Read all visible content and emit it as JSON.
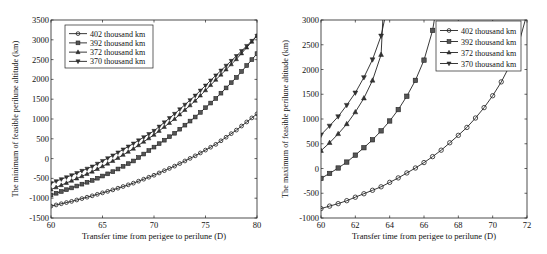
{
  "chart_data": [
    {
      "type": "line",
      "title": "",
      "xlabel": "Transfer time from perigee to perilune (D)",
      "ylabel": "The minimum of feasible perilune altitude (km)",
      "xlim": [
        60,
        80
      ],
      "ylim": [
        -1500,
        3500
      ],
      "xticks": [
        60,
        65,
        70,
        75,
        80
      ],
      "yticks": [
        -1500,
        -1000,
        -500,
        0,
        500,
        1000,
        1500,
        2000,
        2500,
        3000,
        3500
      ],
      "grid": false,
      "legend_position": "upper left",
      "plot_box": {
        "x0": 51,
        "x1": 257,
        "y0": 20,
        "y1": 218
      },
      "legend_box": {
        "x": 65,
        "y": 25,
        "w": 88,
        "h": 43
      },
      "series": [
        {
          "name": "402 thousand km",
          "marker": "circle",
          "x": [
            60,
            62,
            64,
            66,
            68,
            70,
            72,
            74,
            76,
            78,
            80
          ],
          "values": [
            -1200,
            -1080,
            -940,
            -790,
            -620,
            -420,
            -190,
            70,
            360,
            720,
            1130
          ]
        },
        {
          "name": "392 thousand km",
          "marker": "square",
          "x": [
            60,
            62,
            64,
            66,
            68,
            70,
            72,
            74,
            76,
            78,
            80
          ],
          "values": [
            -920,
            -740,
            -550,
            -330,
            -60,
            290,
            640,
            1050,
            1520,
            2050,
            2650
          ]
        },
        {
          "name": "372 thousand km",
          "marker": "triangle-up",
          "x": [
            60,
            62,
            64,
            66,
            68,
            70,
            72,
            74,
            76,
            78,
            80
          ],
          "values": [
            -780,
            -560,
            -330,
            -60,
            250,
            600,
            1000,
            1460,
            1990,
            2510,
            3100
          ]
        },
        {
          "name": "370 thousand km",
          "marker": "triangle-down",
          "x": [
            60,
            62,
            64,
            66,
            68,
            70,
            72,
            74,
            76,
            78,
            80
          ],
          "values": [
            -620,
            -420,
            -200,
            80,
            380,
            700,
            1130,
            1590,
            2100,
            2590,
            3100
          ]
        }
      ]
    },
    {
      "type": "line",
      "title": "",
      "xlabel": "Transfer time from perigee to perilune (D)",
      "ylabel": "The maximum of feasible perilune altitude (km)",
      "xlim": [
        60,
        72
      ],
      "ylim": [
        -1000,
        3000
      ],
      "xticks": [
        60,
        62,
        64,
        66,
        68,
        70,
        72
      ],
      "yticks": [
        -1000,
        -500,
        0,
        500,
        1000,
        1500,
        2000,
        2500,
        3000
      ],
      "grid": false,
      "legend_position": "upper right",
      "plot_box": {
        "x0": 321,
        "x1": 527,
        "y0": 20,
        "y1": 218
      },
      "legend_box": {
        "x": 436,
        "y": 21,
        "w": 85,
        "h": 50
      },
      "series": [
        {
          "name": "402 thousand km",
          "marker": "circle",
          "x": [
            60,
            60.5,
            61,
            61.5,
            62,
            62.5,
            63,
            63.5,
            64,
            64.5,
            65,
            65.5,
            66,
            66.5,
            67,
            67.5,
            68,
            68.5,
            69,
            69.5,
            70,
            70.5,
            71,
            71.5,
            71.9
          ],
          "values": [
            -810,
            -760,
            -710,
            -650,
            -580,
            -510,
            -440,
            -370,
            -280,
            -190,
            -90,
            10,
            120,
            240,
            370,
            520,
            670,
            830,
            1020,
            1230,
            1470,
            1750,
            2080,
            2500,
            3000
          ]
        },
        {
          "name": "392 thousand km",
          "marker": "square",
          "x": [
            60,
            60.5,
            61,
            61.5,
            62,
            62.5,
            63,
            63.5,
            64,
            64.5,
            65,
            65.5,
            66,
            66.5,
            66.6
          ],
          "values": [
            -200,
            -100,
            10,
            130,
            270,
            420,
            580,
            760,
            960,
            1190,
            1460,
            1780,
            2190,
            2790,
            3000
          ]
        },
        {
          "name": "372 thousand km",
          "marker": "triangle-up",
          "x": [
            60,
            60.5,
            61,
            61.5,
            62,
            62.5,
            63,
            63.5,
            63.6
          ],
          "values": [
            360,
            520,
            700,
            900,
            1140,
            1420,
            1780,
            2300,
            3000
          ]
        },
        {
          "name": "370 thousand km",
          "marker": "triangle-down",
          "x": [
            60,
            60.5,
            61,
            61.5,
            62,
            62.5,
            63,
            63.5,
            63.7
          ],
          "values": [
            680,
            860,
            1050,
            1280,
            1530,
            1840,
            2200,
            2680,
            3000
          ]
        }
      ]
    }
  ]
}
